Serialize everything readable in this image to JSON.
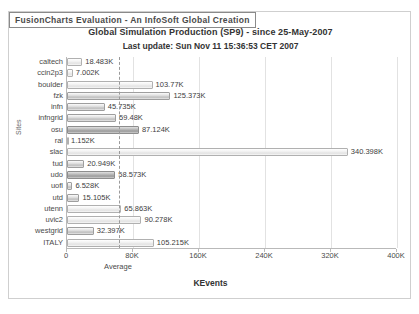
{
  "watermark": {
    "label": "FusionCharts Evaluation - An InfoSoft Global Creation"
  },
  "titles": {
    "caption": "Global Simulation Production (SP9) - since 25-May-2007",
    "subcaption": "Last update: Sun Nov 11 15:36:53 CET 2007"
  },
  "axes": {
    "x_title": "KEvents",
    "y_title": "Sites",
    "average_caption": "Average"
  },
  "colors": {
    "frame_border": "#cfcfcf",
    "grid": "#e2e2e2",
    "axis": "#b9b9b9",
    "bar_fill": "#cfcfcf",
    "bar_border": "#9e9e9e",
    "text": "#4a4a4a",
    "average_line": "#9a9a9a"
  },
  "chart_data": {
    "type": "bar",
    "orientation": "horizontal",
    "title": "Global Simulation Production (SP9) - since 25-May-2007",
    "subtitle": "Last update: Sun Nov 11 15:36:53 CET 2007",
    "xlabel": "KEvents",
    "ylabel": "Sites",
    "xlim": [
      0,
      400
    ],
    "grid": true,
    "legend": "none",
    "unit_suffix": "K",
    "xticks": [
      0,
      80000,
      160000,
      240000,
      320000,
      400000
    ],
    "xtick_labels": [
      "0",
      "80K",
      "160K",
      "240K",
      "320K",
      "400K"
    ],
    "average": 63000,
    "average_label": "Average",
    "categories": [
      "caltech",
      "ccin2p3",
      "boulder",
      "fzk",
      "infn",
      "infngrid",
      "osu",
      "ral",
      "slac",
      "tud",
      "udo",
      "uofl",
      "utd",
      "utenn",
      "uvic2",
      "westgrid",
      "ITALY"
    ],
    "values": [
      18483,
      7002,
      103770,
      125373,
      45735,
      59480,
      87124,
      1152,
      340398,
      20949,
      58573,
      6528,
      15105,
      65863,
      90278,
      32397,
      105215
    ],
    "value_labels": [
      "18.483K",
      "7.002K",
      "103.77K",
      "125.373K",
      "45.735K",
      "59.48K",
      "87.124K",
      "1.152K",
      "340.398K",
      "20.949K",
      "58.573K",
      "6.528K",
      "15.105K",
      "65.863K",
      "90.278K",
      "32.397K",
      "105.215K"
    ],
    "bar_shades": [
      "light",
      "light",
      "light",
      "normal",
      "normal",
      "normal",
      "dark",
      "light",
      "light",
      "normal",
      "dark",
      "normal",
      "normal",
      "light",
      "light",
      "normal",
      "light"
    ]
  }
}
